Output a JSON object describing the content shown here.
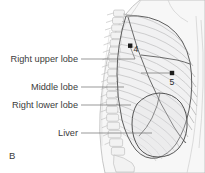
{
  "figure": {
    "panel_letter": "B",
    "background_color": "#ffffff",
    "width": 205,
    "height": 173,
    "view": "lateral chest wall with lung lobes and liver"
  },
  "callouts": [
    {
      "id": "right-upper-lobe",
      "label": "Right upper lobe",
      "text_x": 78,
      "text_y": 62,
      "leader_x1": 81,
      "leader_y1": 59,
      "leader_x2": 135,
      "leader_y2": 59
    },
    {
      "id": "middle-lobe",
      "label": "Middle lobe",
      "text_x": 78,
      "text_y": 90,
      "leader_x1": 81,
      "leader_y1": 87,
      "leader_x2": 124,
      "leader_y2": 87
    },
    {
      "id": "right-lower-lobe",
      "label": "Right lower lobe",
      "text_x": 78,
      "text_y": 108,
      "leader_x1": 81,
      "leader_y1": 105,
      "leader_x2": 131,
      "leader_y2": 105
    },
    {
      "id": "liver",
      "label": "Liver",
      "text_x": 78,
      "text_y": 136,
      "leader_x1": 81,
      "leader_y1": 133,
      "leader_x2": 152,
      "leader_y2": 133
    }
  ],
  "markers": [
    {
      "id": "marker-4",
      "number": "4",
      "dot_x": 130,
      "dot_y": 46,
      "num_x": 133,
      "num_y": 51
    },
    {
      "id": "marker-5",
      "number": "5",
      "dot_x": 172,
      "dot_y": 73,
      "num_x": 169,
      "num_y": 84
    }
  ],
  "marker_leaders": [
    {
      "id": "marker-4-leader",
      "x1": 135,
      "y1": 59,
      "x2": 130,
      "y2": 47
    },
    {
      "id": "marker-5-leader",
      "x1": 141,
      "y1": 73,
      "x2": 172,
      "y2": 73
    }
  ],
  "colors": {
    "text": "#3b3b3b",
    "leader": "#6d6d6d",
    "rib": "#b0b0b0",
    "lung_outline": "#555555",
    "liver_outline": "#4d4d4d",
    "skin": "#f7f7f7",
    "skin_edge": "#b9b9b9",
    "marker_dot": "#1c1c1c"
  }
}
